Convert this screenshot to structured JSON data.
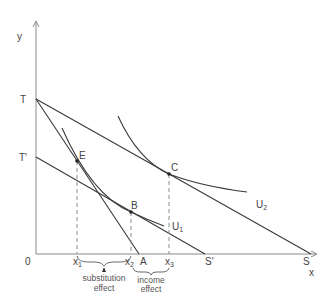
{
  "diagram": {
    "axes": {
      "y_label": "y",
      "x_label": "x",
      "origin_label": "0"
    },
    "points": {
      "T": {
        "label": "T"
      },
      "T_prime": {
        "label": "T'"
      },
      "E": {
        "label": "E"
      },
      "B": {
        "label": "B"
      },
      "C": {
        "label": "C"
      },
      "A": {
        "label": "A"
      },
      "S_prime": {
        "label": "S'"
      },
      "S": {
        "label": "S"
      }
    },
    "x_ticks": {
      "x1": "x",
      "x1_sub": "1",
      "x2": "x",
      "x2_sub": "2",
      "x3": "x",
      "x3_sub": "3"
    },
    "curves": {
      "U1": {
        "label": "U",
        "sub": "1"
      },
      "U2": {
        "label": "U",
        "sub": "2"
      }
    },
    "annotations": {
      "substitution_line1": "substitution",
      "substitution_line2": "effect",
      "income_line1": "income",
      "income_line2": "effect"
    },
    "budget_lines": [
      {
        "name": "TA",
        "from": "T",
        "to": "A"
      },
      {
        "name": "TS",
        "from": "T",
        "to": "S"
      },
      {
        "name": "T'S'",
        "from": "T'",
        "to": "S'"
      }
    ],
    "colors": {
      "line": "#3a3a3a",
      "axis": "#8a8a8a",
      "text": "#444444"
    }
  }
}
